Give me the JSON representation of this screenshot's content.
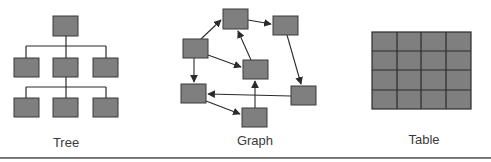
{
  "colors": {
    "node_fill": "#7f7f7f",
    "node_stroke": "#3a3a3a",
    "edge": "#2b2b2b",
    "label": "#3a3a3a",
    "rule": "#707070"
  },
  "panels": [
    {
      "id": "tree",
      "label": "Tree"
    },
    {
      "id": "graph",
      "label": "Graph"
    },
    {
      "id": "table",
      "label": "Table"
    }
  ],
  "tree": {
    "levels": [
      {
        "nodes": 1
      },
      {
        "nodes": 3
      },
      {
        "nodes": 3,
        "parent": "middle"
      }
    ]
  },
  "graph": {
    "nodes": [
      "left-upper",
      "top",
      "top-right",
      "center",
      "left-lower",
      "bottom",
      "right-lower"
    ],
    "edges": [
      [
        "left-upper",
        "top"
      ],
      [
        "top",
        "top-right"
      ],
      [
        "left-upper",
        "center"
      ],
      [
        "center",
        "top"
      ],
      [
        "left-upper",
        "left-lower"
      ],
      [
        "top-right",
        "right-lower"
      ],
      [
        "right-lower",
        "left-lower"
      ],
      [
        "left-lower",
        "bottom"
      ],
      [
        "bottom",
        "center"
      ]
    ]
  },
  "table": {
    "rows": 4,
    "cols": 4
  }
}
